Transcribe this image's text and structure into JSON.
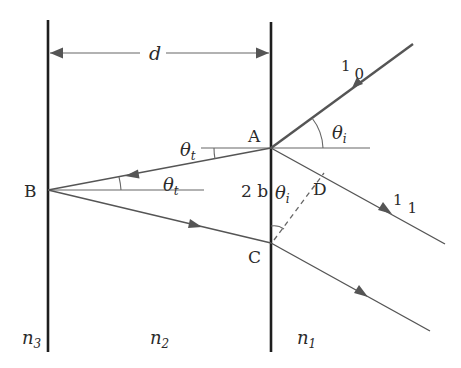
{
  "diagram": {
    "labels": {
      "d": "d",
      "A": "A",
      "B": "B",
      "C": "C",
      "D": "D",
      "two_b": "2 b",
      "theta": "θ",
      "sub_t": "t",
      "sub_i": "i",
      "ray_in_main": "1",
      "ray_in_sub": "0",
      "ray_out_main": "1",
      "ray_out_sub": "1",
      "n": "n",
      "n3_sub": "3",
      "n2_sub": "2",
      "n1_sub": "1"
    },
    "colors": {
      "boundary": "#1e1e1e",
      "ray": "#555555",
      "thin_ray": "#666666",
      "text": "#2a2a2a"
    },
    "regions": [
      "n3",
      "n2",
      "n1"
    ],
    "points": {
      "A": [
        271,
        148
      ],
      "B": [
        48,
        190
      ],
      "C": [
        271,
        243
      ],
      "D": [
        322,
        176
      ]
    }
  }
}
